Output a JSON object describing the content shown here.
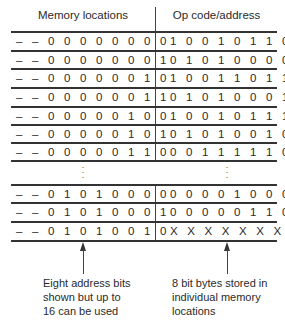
{
  "headers": {
    "left": "Memory locations",
    "right": "Op code/address"
  },
  "rows_top": [
    {
      "address": "– – 0 0 0 0 0 0 0 0",
      "contents": "1 0 0 1 0 1 1 0"
    },
    {
      "address": "– – 0 0 0 0 0 0 0 1",
      "contents": "0 1 0 1 0 0 0 0"
    },
    {
      "address": "– – 0 0 0 0 0 0 1 0",
      "contents": "1 0 0 1 1 0 1 1"
    },
    {
      "address": "– – 0 0 0 0 0 0 1 1",
      "contents": "0 1 0 1 0 0 0 1"
    },
    {
      "address": "– – 0 0 0 0 0 1 0 0",
      "contents": "1 0 0 1 0 1 1 1"
    },
    {
      "address": "– – 0 0 0 0 0 1 0 1",
      "contents": "0 1 0 1 0 0 1 0"
    },
    {
      "address": "– – 0 0 0 0 0 1 1 0",
      "contents": "0 0 1 1 1 1 1 0"
    }
  ],
  "ellipsis": ":",
  "rows_bottom": [
    {
      "address": "– – 0 1 0 1 0 0 0 0",
      "contents": "0 0 0 0 1 0 0 0"
    },
    {
      "address": "– – 0 1 0 1 0 0 0 1",
      "contents": "0 0 0 0 0 1 1 0"
    },
    {
      "address": "– – 0 1 0 1 0 0 1 0",
      "contents": "X X X X X X X X"
    }
  ],
  "annotations": {
    "left": [
      "Eight address bits",
      "shown but up to",
      "16 can be used"
    ],
    "right": [
      "8 bit bytes stored in",
      "individual memory",
      "locations"
    ]
  }
}
